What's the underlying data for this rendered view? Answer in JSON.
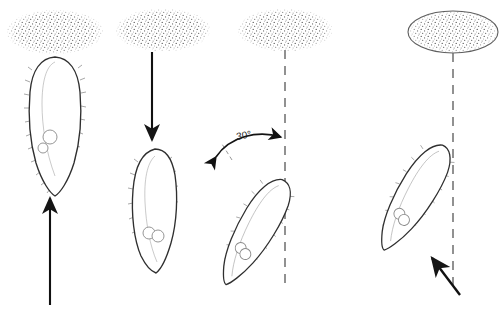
{
  "figure": {
    "background_color": "#ffffff",
    "ink_color": "#2b2b2b",
    "arrow_color": "#111111",
    "stipple_color": "#4a4a4a",
    "dashed_color": "#6e6e6e",
    "width": 501,
    "height": 313
  },
  "panels": [
    {
      "id": "panel-1",
      "substrate_label": "stippled-ellipse",
      "cell_label": "ciliated-cell",
      "cell_tilt_degrees": 0,
      "connector_type": "none",
      "arrow": {
        "name": "upward-arrow",
        "direction": "up",
        "angle_degrees": 0,
        "style": "solid"
      },
      "organelles": 2
    },
    {
      "id": "panel-2",
      "substrate_label": "stippled-ellipse",
      "cell_label": "ciliated-cell",
      "cell_tilt_degrees": 0,
      "connector_type": "none",
      "arrow": {
        "name": "downward-arrow",
        "direction": "down",
        "angle_degrees": 180,
        "style": "solid"
      },
      "organelles": 2
    },
    {
      "id": "panel-3",
      "substrate_label": "stippled-ellipse",
      "cell_label": "ciliated-cell",
      "cell_tilt_degrees": 30,
      "connector_type": "dashed-vertical-line",
      "arrow": {
        "name": "angle-indicator-arrow",
        "direction": "double-headed-arc",
        "angle_degrees": 30,
        "style": "solid"
      },
      "organelles": 2
    },
    {
      "id": "panel-4",
      "substrate_label": "stippled-ellipse-outlined",
      "cell_label": "ciliated-cell",
      "cell_tilt_degrees": 30,
      "connector_type": "dashed-vertical-line",
      "arrow": {
        "name": "diagonal-arrow",
        "direction": "up-left",
        "angle_degrees": 45,
        "style": "solid"
      },
      "organelles": 2
    }
  ],
  "annotations": {
    "angle": {
      "value": "30",
      "unit": "°",
      "text": "30°"
    }
  }
}
